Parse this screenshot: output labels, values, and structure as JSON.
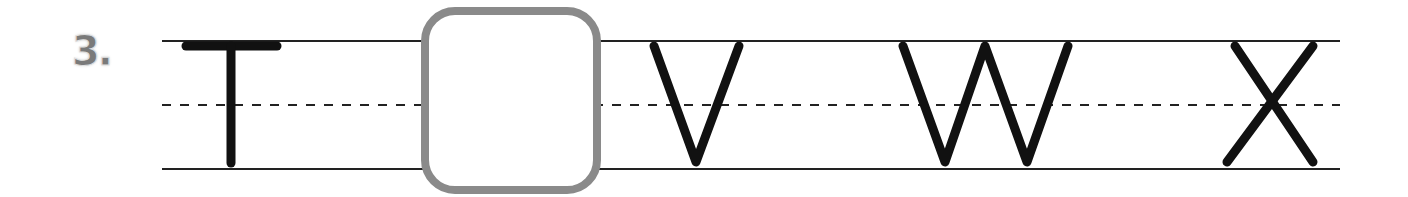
{
  "worksheet": {
    "item_number": "3.",
    "sequence": [
      {
        "letter": "T",
        "type": "given"
      },
      {
        "letter": "",
        "type": "blank",
        "answer_box": true
      },
      {
        "letter": "V",
        "type": "given"
      },
      {
        "letter": "W",
        "type": "given"
      },
      {
        "letter": "X",
        "type": "given"
      }
    ],
    "colors": {
      "ink": "#111111",
      "guide_line": "#222222",
      "box_border": "#8a8a8a",
      "number": "#7a7a7a"
    }
  }
}
